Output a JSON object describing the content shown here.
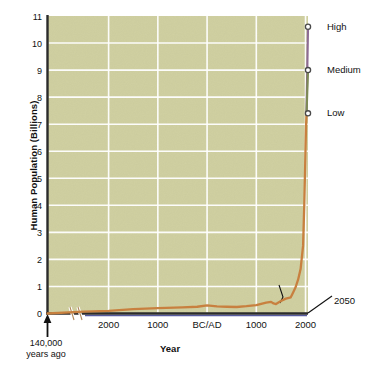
{
  "chart_data": {
    "type": "line",
    "title": "",
    "xlabel": "Year",
    "ylabel": "Human Population (Billions)",
    "ylim": [
      0,
      11
    ],
    "yticks": [
      0,
      1,
      2,
      3,
      4,
      5,
      6,
      7,
      8,
      9,
      10,
      11
    ],
    "xtick_labels": [
      "2000",
      "1000",
      "BC/AD",
      "1000",
      "2000"
    ],
    "xtick_positions_year": [
      -2000,
      -1000,
      0,
      1000,
      2000
    ],
    "grid": true,
    "legend_position": "right-inline-endpoints",
    "plot_bg_color": "#cfcf9f",
    "gridline_color": "#ffffff",
    "axis_color": "#2b2b2b",
    "axis_break": true,
    "axis_break_note": "broken x-axis between 140,000 years ago and ~2500 BC",
    "origin_annotation": {
      "line1": "140,000",
      "line2": "years ago"
    },
    "annotations": [
      {
        "label_line1": "Black",
        "label_line2": "Death",
        "year": 1350,
        "value": 0.37,
        "leader": true
      },
      {
        "label": "2050",
        "note": "projection end year tick outside axis"
      }
    ],
    "series": [
      {
        "name": "Historical human population",
        "color": "#c8803f",
        "points": [
          {
            "year": -140000,
            "value": 0.0
          },
          {
            "year": -2500,
            "value": 0.07
          },
          {
            "year": -2000,
            "value": 0.1
          },
          {
            "year": -1500,
            "value": 0.16
          },
          {
            "year": -1000,
            "value": 0.2
          },
          {
            "year": -500,
            "value": 0.23
          },
          {
            "year": -200,
            "value": 0.25
          },
          {
            "year": 0,
            "value": 0.3
          },
          {
            "year": 200,
            "value": 0.26
          },
          {
            "year": 400,
            "value": 0.25
          },
          {
            "year": 600,
            "value": 0.24
          },
          {
            "year": 800,
            "value": 0.27
          },
          {
            "year": 1000,
            "value": 0.31
          },
          {
            "year": 1200,
            "value": 0.4
          },
          {
            "year": 1300,
            "value": 0.43
          },
          {
            "year": 1350,
            "value": 0.37
          },
          {
            "year": 1400,
            "value": 0.35
          },
          {
            "year": 1500,
            "value": 0.46
          },
          {
            "year": 1600,
            "value": 0.55
          },
          {
            "year": 1700,
            "value": 0.6
          },
          {
            "year": 1750,
            "value": 0.79
          },
          {
            "year": 1800,
            "value": 0.98
          },
          {
            "year": 1850,
            "value": 1.26
          },
          {
            "year": 1900,
            "value": 1.65
          },
          {
            "year": 1950,
            "value": 2.5
          },
          {
            "year": 1975,
            "value": 4.07
          },
          {
            "year": 2000,
            "value": 6.07
          },
          {
            "year": 2010,
            "value": 6.9
          },
          {
            "year": 2020,
            "value": 7.4
          }
        ]
      },
      {
        "name": "High",
        "color": "#8d6b93",
        "label": "High",
        "endpoint_value": 10.6,
        "endpoint_year": 2050
      },
      {
        "name": "Medium",
        "color": "#7d8a55",
        "label": "Medium",
        "endpoint_value": 9.0,
        "endpoint_year": 2050
      },
      {
        "name": "Low",
        "color": "#c8803f",
        "label": "Low",
        "endpoint_value": 7.4,
        "endpoint_year": 2050
      }
    ]
  }
}
